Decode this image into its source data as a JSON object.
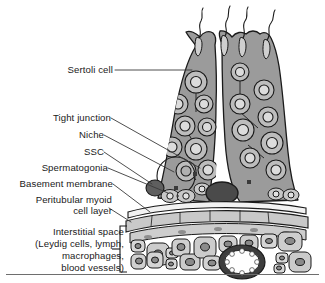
{
  "figure": {
    "type": "biological-schematic"
  },
  "labels": {
    "sertoli_cell": "Sertoli cell",
    "tight_junction": "Tight junction",
    "niche": "Niche",
    "ssc": "SSC",
    "spermatogonia": "Spermatogonia",
    "basement_membrane": "Basement membrane",
    "peritubular_myoid_line1": "Peritubular myoid",
    "peritubular_myoid_line2": "cell layer",
    "interstitial_line1": "Interstitial space",
    "interstitial_line2": "(Leydig cells, lymph,",
    "interstitial_line3": "macrophages,",
    "interstitial_line4": "blood vessels)"
  },
  "colors": {
    "background": "#ffffff",
    "outline": "#1a1a1a",
    "sertoli_cytoplasm": "#9b9b9b",
    "germ_cell_ring": "#bdbdbd",
    "germ_cell_nucleus": "#dcdcdc",
    "ssc_dark": "#5f5f5f",
    "dark_ellipse": "#4a4a4a",
    "myoid_band": "#c9c9c9",
    "basement_band": "#f2f2f2",
    "leydig_cell": "#d0d0d0",
    "leydig_nucleus": "#8a8a8a",
    "vessel_wall": "#3d3d3d",
    "vessel_lumen": "#ffffff",
    "leader_line": "#3a3a3a",
    "text": "#1a1a1a"
  },
  "structures": {
    "spermatozoa_count": 4,
    "sertoli_cell_count": 2,
    "germ_cell_count": 24,
    "leydig_cell_count": 20,
    "blood_vessel_count": 1,
    "myoid_layer_count": 2
  }
}
